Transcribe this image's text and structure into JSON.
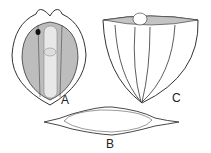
{
  "figure": {
    "panels": [
      {
        "id": "A",
        "label": "A",
        "description": "front view, oval cell with dark eyespot and central striated body"
      },
      {
        "id": "B",
        "label": "B",
        "description": "side view, elongated spindle shape"
      },
      {
        "id": "C",
        "label": "C",
        "description": "end view, cup shape with ribs"
      }
    ],
    "colors": {
      "stroke": "#333333",
      "fill": "#bdbdbd",
      "light": "#e8e8e8"
    }
  }
}
